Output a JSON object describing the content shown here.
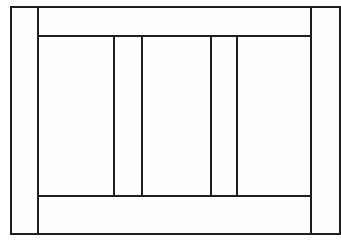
{
  "diagram": {
    "title": "",
    "stroke_color": "#1e1e1e",
    "background_color": "#ffffff",
    "frame": {
      "x": 10,
      "y": 6,
      "width": 330,
      "height": 229
    },
    "panels": [
      {
        "name": "left-stile",
        "x": 10,
        "y": 6,
        "width": 29,
        "height": 229
      },
      {
        "name": "right-stile",
        "x": 310,
        "y": 6,
        "width": 30,
        "height": 229
      },
      {
        "name": "top-rail",
        "x": 38,
        "y": 6,
        "width": 273,
        "height": 30
      },
      {
        "name": "bottom-rail",
        "x": 38,
        "y": 195,
        "width": 273,
        "height": 40
      },
      {
        "name": "pane-left",
        "x": 38,
        "y": 35,
        "width": 76,
        "height": 161
      },
      {
        "name": "mullion-left",
        "x": 113,
        "y": 35,
        "width": 29,
        "height": 161
      },
      {
        "name": "pane-center",
        "x": 141,
        "y": 35,
        "width": 70,
        "height": 161
      },
      {
        "name": "mullion-right",
        "x": 210,
        "y": 35,
        "width": 27,
        "height": 161
      },
      {
        "name": "pane-right",
        "x": 236,
        "y": 35,
        "width": 75,
        "height": 161
      }
    ]
  }
}
